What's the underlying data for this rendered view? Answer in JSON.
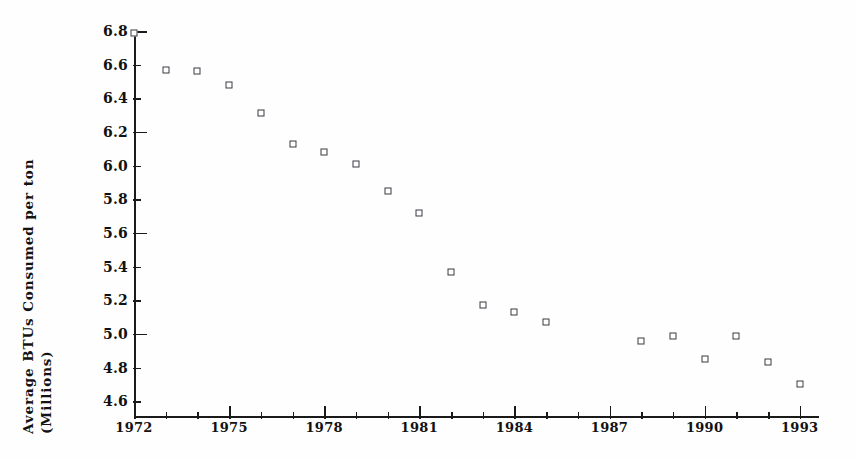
{
  "chart_data": {
    "type": "scatter",
    "title": "",
    "xlabel": "",
    "ylabel": "Average BTUs Consumed per ton (Millions)",
    "ylabel_lines": [
      "Average BTUs Consumed per ton",
      "(Millions)"
    ],
    "xlim": [
      1972,
      1993
    ],
    "ylim": [
      4.5,
      6.8
    ],
    "grid": false,
    "legend": null,
    "marker": "open-square",
    "marker_color": "#3a3a42",
    "axis_color": "#1a1a1a",
    "x": [
      1972,
      1973,
      1974,
      1975,
      1976,
      1977,
      1978,
      1979,
      1980,
      1981,
      1982,
      1983,
      1984,
      1985,
      1988,
      1989,
      1990,
      1991,
      1992,
      1993
    ],
    "values": [
      6.79,
      6.57,
      6.56,
      6.48,
      6.31,
      6.13,
      6.08,
      6.01,
      5.85,
      5.72,
      5.37,
      5.17,
      5.13,
      5.07,
      4.96,
      4.99,
      4.85,
      4.99,
      4.83,
      4.7
    ],
    "missing_years": [
      1986,
      1987
    ],
    "ytick_labels": [
      "6.8",
      "6.6",
      "6.4",
      "6.2",
      "6.0",
      "5.8",
      "5.6",
      "5.4",
      "5.2",
      "5.0",
      "4.8",
      "4.6"
    ],
    "ytick_values": [
      6.8,
      6.6,
      6.4,
      6.2,
      6.0,
      5.8,
      5.6,
      5.4,
      5.2,
      5.0,
      4.8,
      4.6
    ],
    "ytick_major": [
      6.8,
      6.2,
      5.6,
      5.0
    ],
    "xtick_values": [
      1972,
      1973,
      1974,
      1975,
      1976,
      1977,
      1978,
      1979,
      1980,
      1981,
      1982,
      1983,
      1984,
      1985,
      1986,
      1987,
      1988,
      1989,
      1990,
      1991,
      1992,
      1993
    ],
    "xtick_labels": [
      "1972",
      "",
      "",
      "1975",
      "",
      "",
      "1978",
      "",
      "",
      "1981",
      "",
      "",
      "1984",
      "",
      "",
      "1987",
      "",
      "",
      "1990",
      "",
      "",
      "1993"
    ],
    "xtick_major": [
      1972,
      1975,
      1978,
      1981,
      1984,
      1987,
      1990,
      1993
    ]
  }
}
